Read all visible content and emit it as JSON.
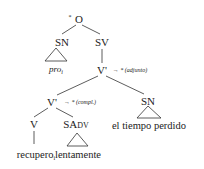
{
  "tree": {
    "root": {
      "label": "O",
      "mark": "*"
    },
    "nodes": {
      "sn_subject": {
        "label": "SN",
        "leaf": "pro",
        "leaf_subscript": "i",
        "leaf_italic": true
      },
      "sv": {
        "label": "SV"
      },
      "vbar_top": {
        "label": "V'",
        "arrow_annotation": "→ * (adjunto)"
      },
      "vbar_low": {
        "label": "V'",
        "arrow_annotation": "→ * (compl.)"
      },
      "v": {
        "label": "V",
        "leaf": "recupero",
        "leaf_subscript": "i"
      },
      "sadv": {
        "label_main": "SA",
        "label_small": "DV",
        "leaf": "lentamente"
      },
      "sn_object": {
        "label": "SN",
        "leaf": "el tiempo perdido"
      }
    }
  },
  "colors": {
    "ink": "#222222",
    "background": "#ffffff"
  }
}
